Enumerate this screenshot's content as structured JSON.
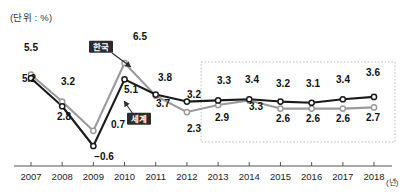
{
  "unit_label": "(단위 : %)",
  "axis_unit": "(년)",
  "colors": {
    "world_line": "#1a1a1a",
    "korea_line": "#9b9b9b",
    "marker_fill": "#ffffff",
    "axis": "#555555",
    "forecast_box": "#bdbdbd",
    "tag_bg": "#2b2b2b",
    "tag_text": "#ffffff"
  },
  "series_tags": [
    {
      "name": "korea-tag",
      "label": "한국",
      "x": 101,
      "y": 47
    },
    {
      "name": "world-tag",
      "label": "세계",
      "x": 139,
      "y": 119
    }
  ],
  "chart_data": {
    "type": "line",
    "title": "",
    "subtitle": "",
    "xlabel": "(년)",
    "ylabel": "(단위 : %)",
    "ylim": [
      -1.5,
      7.2
    ],
    "grid": false,
    "legend": "inline-annotations",
    "categories": [
      "2007",
      "2008",
      "2009",
      "2010",
      "2011",
      "2012",
      "2013",
      "2014",
      "2015",
      "2016",
      "2017",
      "2018"
    ],
    "x": [
      2007,
      2008,
      2009,
      2010,
      2011,
      2012,
      2013,
      2014,
      2015,
      2016,
      2017,
      2018
    ],
    "series": [
      {
        "name": "세계",
        "name_en": "World",
        "color": "#1a1a1a",
        "values": [
          5.2,
          2.8,
          -0.6,
          5.1,
          3.8,
          3.2,
          3.3,
          3.4,
          3.2,
          3.1,
          3.4,
          3.6
        ],
        "labels": [
          "5.2",
          "2.8",
          "−0.6",
          "5.1",
          "3.8",
          "3.2",
          "3.3",
          "3.4",
          "3.2",
          "3.1",
          "3.4",
          "3.6"
        ]
      },
      {
        "name": "한국",
        "name_en": "Korea",
        "color": "#9b9b9b",
        "values": [
          5.5,
          3.2,
          0.7,
          6.5,
          3.7,
          2.3,
          2.9,
          3.3,
          2.6,
          2.6,
          2.6,
          2.7
        ],
        "labels": [
          "5.5",
          "3.2",
          "0.7",
          "6.5",
          "3.7",
          "2.3",
          "2.9",
          "3.3",
          "2.6",
          "2.6",
          "2.6",
          "2.7"
        ]
      }
    ],
    "annotations": [
      {
        "type": "forecast-region",
        "from": "2013",
        "to": "2018",
        "style": "dotted-rectangle"
      }
    ]
  },
  "tick_labels": [
    "2007",
    "2008",
    "2009",
    "2010",
    "2011",
    "2012",
    "2013",
    "2014",
    "2015",
    "2016",
    "2017",
    "2018"
  ],
  "point_labels": [
    {
      "name": "world-label-2007",
      "text": "5.2",
      "x": 29,
      "y": 78
    },
    {
      "name": "korea-label-2007",
      "text": "5.5",
      "x": 31,
      "y": 47
    },
    {
      "name": "world-label-2008",
      "text": "2.8",
      "x": 64,
      "y": 116
    },
    {
      "name": "korea-label-2008",
      "text": "3.2",
      "x": 68,
      "y": 81
    },
    {
      "name": "world-label-2009",
      "text": "−0.6",
      "x": 104,
      "y": 156
    },
    {
      "name": "korea-label-2009",
      "text": "0.7",
      "x": 118,
      "y": 124
    },
    {
      "name": "world-label-2010",
      "text": "5.1",
      "x": 131,
      "y": 89
    },
    {
      "name": "korea-label-2010",
      "text": "6.5",
      "x": 140,
      "y": 36
    },
    {
      "name": "world-label-2011",
      "text": "3.8",
      "x": 165,
      "y": 77
    },
    {
      "name": "korea-label-2011",
      "text": "3.7",
      "x": 163,
      "y": 103
    },
    {
      "name": "world-label-2012",
      "text": "3.2",
      "x": 194,
      "y": 94
    },
    {
      "name": "korea-label-2012",
      "text": "2.3",
      "x": 194,
      "y": 128
    },
    {
      "name": "world-label-2013",
      "text": "3.3",
      "x": 224,
      "y": 80
    },
    {
      "name": "korea-label-2013",
      "text": "2.9",
      "x": 222,
      "y": 117
    },
    {
      "name": "world-label-2014",
      "text": "3.4",
      "x": 252,
      "y": 79
    },
    {
      "name": "korea-label-2014",
      "text": "3.3",
      "x": 256,
      "y": 106
    },
    {
      "name": "world-label-2015",
      "text": "3.2",
      "x": 283,
      "y": 83
    },
    {
      "name": "korea-label-2015",
      "text": "2.6",
      "x": 283,
      "y": 118
    },
    {
      "name": "world-label-2016",
      "text": "3.1",
      "x": 313,
      "y": 83
    },
    {
      "name": "korea-label-2016",
      "text": "2.6",
      "x": 313,
      "y": 118
    },
    {
      "name": "world-label-2017",
      "text": "3.4",
      "x": 343,
      "y": 79
    },
    {
      "name": "korea-label-2017",
      "text": "2.6",
      "x": 343,
      "y": 118
    },
    {
      "name": "world-label-2018",
      "text": "3.6",
      "x": 373,
      "y": 72
    },
    {
      "name": "korea-label-2018",
      "text": "2.7",
      "x": 373,
      "y": 117
    }
  ]
}
